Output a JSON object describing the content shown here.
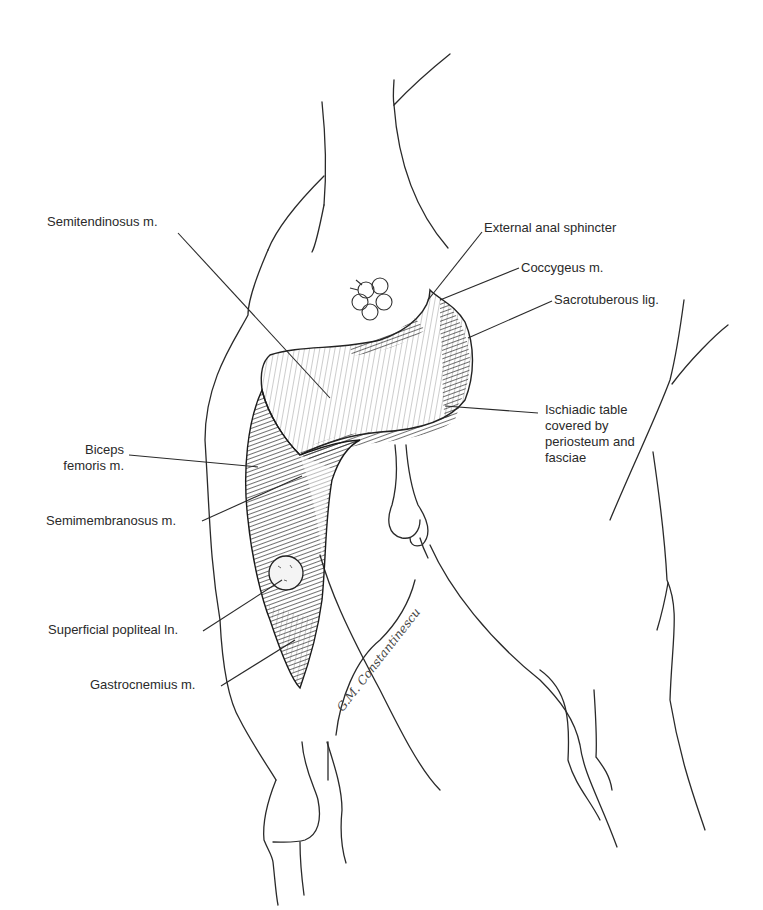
{
  "figure": {
    "type": "anatomical-illustration",
    "colors": {
      "ink": "#2a2a2a",
      "background": "#ffffff"
    }
  },
  "labels": {
    "semitendinosus": "Semitendinosus m.",
    "external_anal_sphincter": "External anal sphincter",
    "coccygeus": "Coccygeus m.",
    "sacrotuberous": "Sacrotuberous lig.",
    "ischiadic_table": "Ischiadic table\ncovered by\nperiosteum and\nfasciae",
    "biceps_femoris": "Biceps\nfemoris m.",
    "semimembranosus": "Semimembranosus m.",
    "superficial_popliteal": "Superficial popliteal ln.",
    "gastrocnemius": "Gastrocnemius m."
  },
  "signature": "G.M. Constantinescu"
}
